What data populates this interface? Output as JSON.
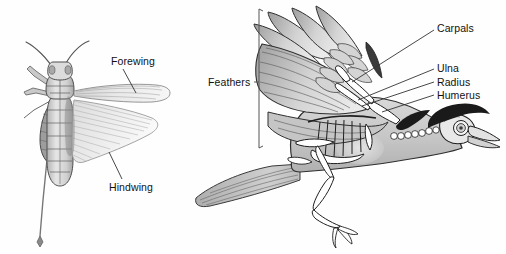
{
  "figure": {
    "background_color": "#fefefe",
    "ink_color": "#111111",
    "panels": [
      {
        "name": "grasshopper-panel",
        "subject": "grasshopper",
        "view": "dorsal",
        "labels": [
          "Forewing",
          "Hindwing"
        ]
      },
      {
        "name": "bird-panel",
        "subject": "bird",
        "view": "lateral-flight",
        "labels": [
          "Feathers",
          "Carpals",
          "Ulna",
          "Radius",
          "Humerus"
        ]
      }
    ]
  },
  "grasshopper": {
    "labels": {
      "forewing": "Forewing",
      "hindwing": "Hindwing"
    },
    "parts": [
      "antenna-left",
      "antenna-right",
      "head",
      "pronotum",
      "thorax",
      "abdomen",
      "foreleg",
      "hindleg-femur",
      "hindleg-tibia",
      "forewing",
      "hindwing",
      "ovipositor"
    ]
  },
  "bird": {
    "labels": {
      "feathers": "Feathers",
      "carpals": "Carpals",
      "ulna": "Ulna",
      "radius": "Radius",
      "humerus": "Humerus"
    },
    "parts": [
      "primary-feathers",
      "secondary-feathers",
      "covert-feathers",
      "tail-feathers",
      "skull",
      "eye-socket",
      "beak",
      "crest",
      "cervical-vertebrae",
      "ribcage",
      "sternum",
      "pelvis",
      "femur",
      "tibiotarsus",
      "tarsometatarsus",
      "claw",
      "humerus-bone",
      "radius-bone",
      "ulna-bone",
      "carpal-bones"
    ]
  },
  "colors": {
    "ink": "#111111",
    "leader_line": "#333333",
    "bracket": "#555555",
    "wing_light": "#f2f2f2",
    "wing_mid": "#d8d8d8",
    "wing_dark": "#a8a8a8",
    "body_light": "#e4e4e4",
    "body_mid": "#c4c4c4",
    "body_dark": "#8f8f8f",
    "bone_fill": "#ffffff",
    "crest_black": "#1a1a1a"
  }
}
